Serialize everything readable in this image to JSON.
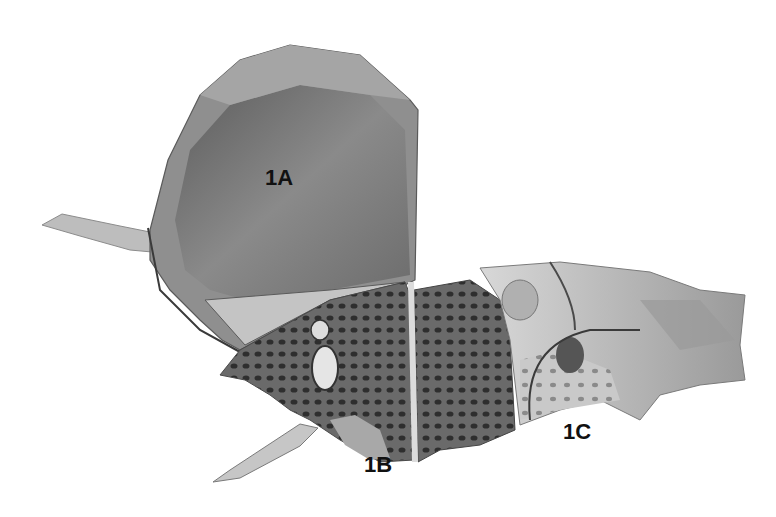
{
  "figure": {
    "background": "#ffffff",
    "colors": {
      "dark": "#4a4a4a",
      "mid": "#7d7d7d",
      "light": "#b8b8b8",
      "pale": "#dcdcdc",
      "label": "#111111"
    },
    "labels": [
      {
        "id": "1A",
        "text": "1A",
        "x": 265,
        "y": 165
      },
      {
        "id": "1B",
        "text": "1B",
        "x": 364,
        "y": 452
      },
      {
        "id": "1C",
        "text": "1C",
        "x": 563,
        "y": 419
      }
    ]
  }
}
